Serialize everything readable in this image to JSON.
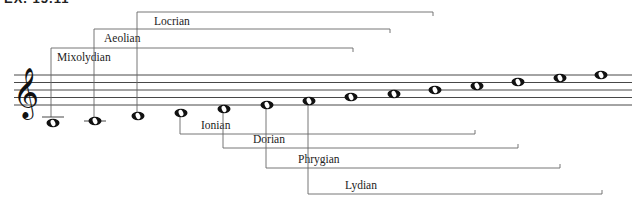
{
  "figure": {
    "cut_label": "EX. 15.11",
    "clef": "treble-clef",
    "staff": {
      "x1": 14,
      "x2": 632,
      "lines_y": [
        75,
        82.5,
        90,
        97.5,
        105
      ],
      "color": "#333333"
    },
    "notes": [
      {
        "x": 53,
        "y": 123,
        "ledger": true
      },
      {
        "x": 95,
        "y": 121,
        "ledger": true
      },
      {
        "x": 138,
        "y": 116,
        "ledger": false
      },
      {
        "x": 181,
        "y": 113,
        "ledger": false
      },
      {
        "x": 224,
        "y": 109,
        "ledger": false
      },
      {
        "x": 267,
        "y": 105,
        "ledger": false
      },
      {
        "x": 309,
        "y": 101,
        "ledger": false
      },
      {
        "x": 351,
        "y": 97,
        "ledger": false
      },
      {
        "x": 394,
        "y": 94,
        "ledger": false
      },
      {
        "x": 435,
        "y": 90,
        "ledger": false
      },
      {
        "x": 477,
        "y": 86,
        "ledger": false
      },
      {
        "x": 518,
        "y": 82,
        "ledger": false
      },
      {
        "x": 560,
        "y": 78,
        "ledger": false
      },
      {
        "x": 601,
        "y": 75,
        "ledger": false
      }
    ],
    "modes_above": [
      {
        "name": "Mixolydian",
        "x1": 51,
        "x2": 353,
        "y": 48,
        "start_y": 117,
        "label_x": 57
      },
      {
        "name": "Aeolian",
        "x1": 94,
        "x2": 390,
        "y": 29,
        "start_y": 117,
        "label_x": 104
      },
      {
        "name": "Locrian",
        "x1": 137,
        "x2": 433,
        "y": 12,
        "start_y": 112,
        "label_x": 154
      }
    ],
    "modes_below": [
      {
        "name": "Ionian",
        "x1": 180,
        "x2": 475,
        "y": 134,
        "start_y": 116,
        "label_x": 201
      },
      {
        "name": "Dorian",
        "x1": 223,
        "x2": 518,
        "y": 148,
        "start_y": 112,
        "label_x": 253
      },
      {
        "name": "Phrygian",
        "x1": 266,
        "x2": 560,
        "y": 168,
        "start_y": 108,
        "label_x": 298
      },
      {
        "name": "Lydian",
        "x1": 308,
        "x2": 602,
        "y": 194,
        "start_y": 104,
        "label_x": 345
      }
    ]
  }
}
